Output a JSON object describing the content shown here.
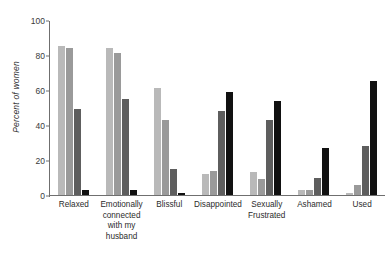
{
  "chart_data": {
    "type": "bar",
    "title": "",
    "xlabel": "",
    "ylabel": "Percent of women",
    "ylim": [
      0,
      100
    ],
    "yticks": [
      0,
      20,
      40,
      60,
      80,
      100
    ],
    "grid": false,
    "legend": "none",
    "categories": [
      "Relaxed",
      "Emotionally connected with my husband",
      "Blissful",
      "Disappointed",
      "Sexually Frustrated",
      "Ashamed",
      "Used"
    ],
    "category_lines": [
      [
        "Relaxed"
      ],
      [
        "Emotionally",
        "connected",
        "with my",
        "husband"
      ],
      [
        "Blissful"
      ],
      [
        "Disappointed"
      ],
      [
        "Sexually",
        "Frustrated"
      ],
      [
        "Ashamed"
      ],
      [
        "Used"
      ]
    ],
    "series": [
      {
        "name": "series-1",
        "color": "#b9b9b9",
        "values": [
          85,
          84,
          61,
          12,
          13,
          3,
          1
        ]
      },
      {
        "name": "series-2",
        "color": "#9a9a9a",
        "values": [
          84,
          81,
          43,
          14,
          9,
          3,
          6
        ]
      },
      {
        "name": "series-3",
        "color": "#5e5e5e",
        "values": [
          49,
          55,
          15,
          48,
          43,
          10,
          28
        ]
      },
      {
        "name": "series-4",
        "color": "#111111",
        "values": [
          3,
          3,
          1,
          59,
          54,
          27,
          65
        ]
      }
    ]
  }
}
